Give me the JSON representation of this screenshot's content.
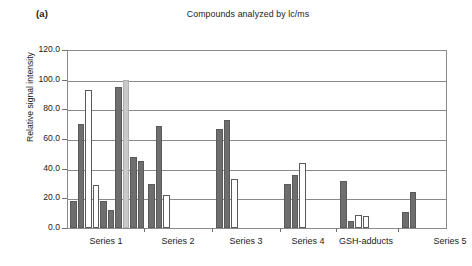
{
  "figure": {
    "panel_label": "(a)",
    "title": "Compounds analyzed by lc/ms"
  },
  "colors": {
    "bar_dark": "#6e6e6e",
    "bar_light": "#c9c9c9",
    "bar_white": "#ffffff",
    "bar_outline": "#5a5a5a",
    "axis": "#8a8a8a",
    "grid": "#8a8a8a",
    "text": "#1a1a1a"
  },
  "axes": {
    "ylabel": "Relative signal intensity",
    "yticks": [
      "0.0",
      "20.0",
      "40.0",
      "60.0",
      "80.0",
      "100.0",
      "120.0"
    ],
    "ymin": 0,
    "ymax": 120,
    "xlabels": [
      "Series 1",
      "Series 2",
      "Series 3",
      "Series 4",
      "GSH-adducts",
      "Series 5"
    ]
  },
  "chart_data": {
    "type": "bar",
    "title": "Compounds analyzed by lc/ms",
    "xlabel": "",
    "ylabel": "Relative signal intensity",
    "ylim": [
      0,
      120
    ],
    "ytick_step": 20,
    "grid": true,
    "legend": "none",
    "categories": [
      "Series 1",
      "Series 2",
      "Series 3",
      "Series 4",
      "GSH-adducts",
      "Series 5"
    ],
    "groups": [
      {
        "category": "Series 1",
        "bars": [
          {
            "value": 18,
            "fill": "dark"
          },
          {
            "value": 70,
            "fill": "dark"
          },
          {
            "value": 93,
            "fill": "white"
          },
          {
            "value": 29,
            "fill": "white"
          },
          {
            "value": 18,
            "fill": "dark"
          },
          {
            "value": 12,
            "fill": "dark"
          },
          {
            "value": 95,
            "fill": "dark"
          },
          {
            "value": 100,
            "fill": "light"
          },
          {
            "value": 48,
            "fill": "dark"
          },
          {
            "value": 45,
            "fill": "dark"
          }
        ]
      },
      {
        "category": "Series 2",
        "bars": [
          {
            "value": 30,
            "fill": "dark"
          },
          {
            "value": 69,
            "fill": "dark"
          },
          {
            "value": 22,
            "fill": "white"
          }
        ]
      },
      {
        "category": "Series 3",
        "bars": [
          {
            "value": 67,
            "fill": "dark"
          },
          {
            "value": 73,
            "fill": "dark"
          },
          {
            "value": 33,
            "fill": "white"
          }
        ]
      },
      {
        "category": "Series 4",
        "bars": [
          {
            "value": 30,
            "fill": "dark"
          },
          {
            "value": 36,
            "fill": "dark"
          },
          {
            "value": 44,
            "fill": "white"
          }
        ]
      },
      {
        "category": "GSH-adducts",
        "bars": [
          {
            "value": 32,
            "fill": "dark"
          },
          {
            "value": 5,
            "fill": "dark"
          },
          {
            "value": 9,
            "fill": "white"
          },
          {
            "value": 8,
            "fill": "white"
          }
        ]
      },
      {
        "category": "Series 5",
        "bars": [
          {
            "value": 11,
            "fill": "dark"
          },
          {
            "value": 24,
            "fill": "dark"
          }
        ]
      }
    ]
  },
  "layout": {
    "bar_positions": [
      {
        "x": 2,
        "w": 6.5,
        "group": 0,
        "i": 0
      },
      {
        "x": 9.5,
        "w": 6.5,
        "group": 0,
        "i": 1
      },
      {
        "x": 17,
        "w": 6.5,
        "group": 0,
        "i": 2
      },
      {
        "x": 24.5,
        "w": 6.5,
        "group": 0,
        "i": 3
      },
      {
        "x": 32,
        "w": 6.5,
        "group": 0,
        "i": 4
      },
      {
        "x": 39.5,
        "w": 6.5,
        "group": 0,
        "i": 5
      },
      {
        "x": 47,
        "w": 6.5,
        "group": 0,
        "i": 6
      },
      {
        "x": 54,
        "w": 6.5,
        "group": 0,
        "i": 7
      },
      {
        "x": 61.5,
        "w": 6.5,
        "group": 0,
        "i": 8
      },
      {
        "x": 69,
        "w": 6.5,
        "group": 0,
        "i": 9
      }
    ],
    "group_separators": [
      76,
      144,
      212,
      268,
      330
    ],
    "xlabel_centers": [
      38,
      110,
      178,
      240,
      298,
      382
    ]
  }
}
